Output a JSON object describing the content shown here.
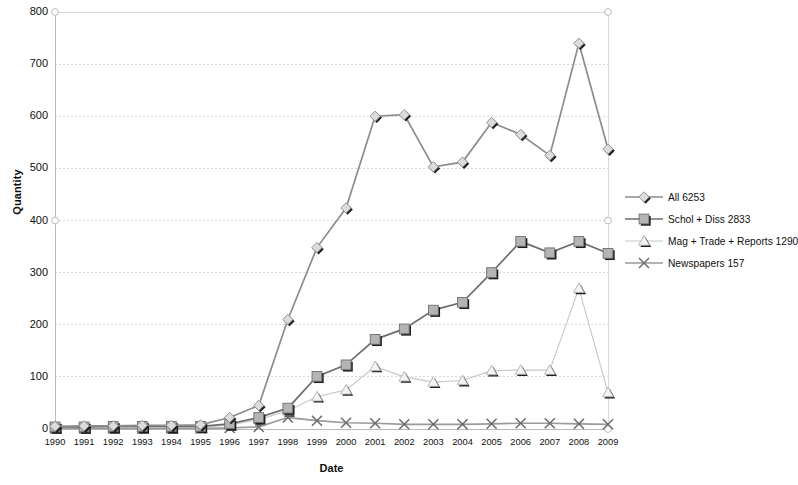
{
  "chart_data": {
    "type": "line",
    "title": "",
    "xlabel": "Date",
    "ylabel": "Quantity",
    "ylim": [
      0,
      800
    ],
    "ytick_values": [
      0,
      100,
      200,
      300,
      400,
      500,
      600,
      700,
      800
    ],
    "ytick_labels": [
      "0",
      "100",
      "200",
      "300",
      "400",
      "500",
      "600",
      "700",
      "800"
    ],
    "grid": true,
    "legend_position": "right",
    "categories": [
      "1990",
      "1991",
      "1992",
      "1993",
      "1994",
      "1995",
      "1996",
      "1997",
      "1998",
      "1999",
      "2000",
      "2001",
      "2002",
      "2003",
      "2004",
      "2005",
      "2006",
      "2007",
      "2008",
      "2009"
    ],
    "x": [
      1990,
      1991,
      1992,
      1993,
      1994,
      1995,
      1996,
      1997,
      1998,
      1999,
      2000,
      2001,
      2002,
      2003,
      2004,
      2005,
      2006,
      2007,
      2008,
      2009
    ],
    "series": [
      {
        "name": "All 6253",
        "label": "All 6253",
        "marker": "diamond",
        "color": "#8c8c8c",
        "values": [
          5,
          6,
          6,
          7,
          7,
          8,
          22,
          45,
          210,
          348,
          424,
          600,
          603,
          503,
          512,
          588,
          565,
          525,
          740,
          537
        ]
      },
      {
        "name": "Schol + Diss 2833",
        "label": "Schol + Diss 2833",
        "marker": "square",
        "color": "#6e6e6e",
        "values": [
          4,
          4,
          5,
          5,
          5,
          5,
          10,
          22,
          40,
          101,
          123,
          172,
          192,
          228,
          243,
          300,
          360,
          338,
          360,
          337
        ]
      },
      {
        "name": "Mag + Trade + Reports 1290",
        "label": "Mag + Trade + Reports 1290",
        "marker": "triangle",
        "color": "#c8c8c8",
        "values": [
          2,
          2,
          2,
          2,
          2,
          3,
          8,
          18,
          35,
          62,
          75,
          120,
          100,
          90,
          93,
          112,
          113,
          113,
          270,
          70
        ]
      },
      {
        "name": "Newspapers 157",
        "label": "Newspapers 157",
        "marker": "cross",
        "color": "#9a9a9a",
        "values": [
          1,
          1,
          1,
          1,
          1,
          1,
          2,
          4,
          22,
          16,
          12,
          11,
          9,
          9,
          9,
          10,
          11,
          11,
          10,
          9
        ]
      }
    ]
  },
  "legend": {
    "items": [
      {
        "label": "All 6253",
        "marker": "diamond"
      },
      {
        "label": "Schol + Diss 2833",
        "marker": "square"
      },
      {
        "label": "Mag + Trade + Reports 1290",
        "marker": "triangle"
      },
      {
        "label": "Newspapers 157",
        "marker": "cross"
      }
    ]
  },
  "axes": {
    "y_title": "Quantity",
    "x_title": "Date"
  }
}
